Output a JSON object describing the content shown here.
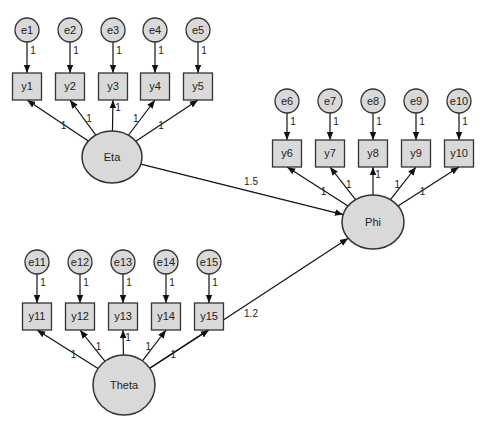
{
  "diagram": {
    "type": "structural equation model",
    "colors": {
      "node_fill": "#d9d9d9",
      "stroke": "#333333",
      "background": "#ffffff"
    },
    "latents": [
      {
        "id": "eta",
        "label": "Eta",
        "cx": 112,
        "cy": 157,
        "rx": 30,
        "ry": 26
      },
      {
        "id": "phi",
        "label": "Phi",
        "cx": 373,
        "cy": 222,
        "rx": 31,
        "ry": 27
      },
      {
        "id": "theta",
        "label": "Theta",
        "cx": 124,
        "cy": 385,
        "rx": 31,
        "ry": 30
      }
    ],
    "groups": [
      {
        "latent": "eta",
        "box_top": 73,
        "err_cy": 30,
        "indicators": [
          {
            "label": "y1",
            "error": "e1",
            "x": 27,
            "loading": "1",
            "err_weight": "1"
          },
          {
            "label": "y2",
            "error": "e2",
            "x": 70,
            "loading": "1",
            "err_weight": "1"
          },
          {
            "label": "y3",
            "error": "e3",
            "x": 113,
            "loading": "1",
            "err_weight": "1"
          },
          {
            "label": "y4",
            "error": "e4",
            "x": 155,
            "loading": "1",
            "err_weight": "1"
          },
          {
            "label": "y5",
            "error": "e5",
            "x": 198,
            "loading": "1",
            "err_weight": "1"
          }
        ]
      },
      {
        "latent": "phi",
        "box_top": 140,
        "err_cy": 101,
        "indicators": [
          {
            "label": "y6",
            "error": "e6",
            "x": 287,
            "loading": "1",
            "err_weight": "1"
          },
          {
            "label": "y7",
            "error": "e7",
            "x": 330,
            "loading": "1",
            "err_weight": "1"
          },
          {
            "label": "y8",
            "error": "e8",
            "x": 373,
            "loading": "1",
            "err_weight": "1"
          },
          {
            "label": "y9",
            "error": "e9",
            "x": 416,
            "loading": "1",
            "err_weight": "1"
          },
          {
            "label": "y10",
            "error": "e10",
            "x": 459,
            "loading": "1",
            "err_weight": "1"
          }
        ]
      },
      {
        "latent": "theta",
        "box_top": 303,
        "err_cy": 262,
        "indicators": [
          {
            "label": "y11",
            "error": "e11",
            "x": 37,
            "loading": "1",
            "err_weight": "1"
          },
          {
            "label": "y12",
            "error": "e12",
            "x": 80,
            "loading": "1",
            "err_weight": "1"
          },
          {
            "label": "y13",
            "error": "e13",
            "x": 123,
            "loading": "1",
            "err_weight": "1"
          },
          {
            "label": "y14",
            "error": "e14",
            "x": 166,
            "loading": "1",
            "err_weight": "1"
          },
          {
            "label": "y15",
            "error": "e15",
            "x": 209,
            "loading": "1",
            "err_weight": "1"
          }
        ]
      }
    ],
    "paths": [
      {
        "from": "eta",
        "to": "phi",
        "weight": "1.5",
        "label_x": 243,
        "label_y": 182
      },
      {
        "from": "theta",
        "to": "phi",
        "weight": "1.2",
        "label_x": 243,
        "label_y": 314
      }
    ]
  }
}
